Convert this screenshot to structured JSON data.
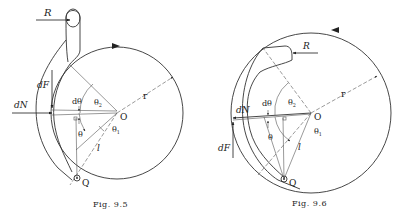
{
  "figures": [
    {
      "id": "fig-9-5",
      "caption": "Fig. 9.5",
      "labels": {
        "R": "R",
        "dF": "dF",
        "dN": "dN",
        "dtheta": "dθ",
        "theta": "θ",
        "theta1": "θ",
        "theta1_sub": "1",
        "theta2": "θ",
        "theta2_sub": "2",
        "O": "O",
        "r": "r",
        "l": "l",
        "Q": "Q"
      },
      "drum_rotation": "clockwise",
      "shoe_position": "outside"
    },
    {
      "id": "fig-9-6",
      "caption": "Fig. 9.6",
      "labels": {
        "R": "R",
        "dF": "dF",
        "dN": "dN",
        "dtheta": "dθ",
        "theta": "θ",
        "theta1": "θ",
        "theta1_sub": "1",
        "theta2": "θ",
        "theta2_sub": "2",
        "O": "O",
        "r": "r",
        "l": "l",
        "Q": "Q"
      },
      "drum_rotation": "counterclockwise",
      "shoe_position": "inside"
    }
  ]
}
